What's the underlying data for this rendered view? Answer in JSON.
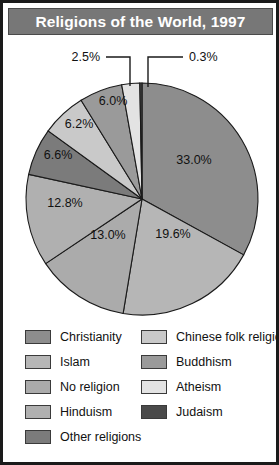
{
  "header": {
    "title": "Religions of the World, 1997",
    "background_color": "#777777",
    "text_color": "#ffffff"
  },
  "frame": {
    "border_color": "#1a1a1a",
    "background_color": "#ffffff"
  },
  "chart_data": {
    "type": "pie",
    "title": "Religions of the World, 1997",
    "xlabel": "",
    "ylabel": "",
    "legend_position": "bottom",
    "grid": false,
    "start_angle_deg": 0,
    "direction": "clockwise",
    "categories": [
      "Christianity",
      "Islam",
      "No religion",
      "Hinduism",
      "Other religions",
      "Chinese folk religion",
      "Buddhism",
      "Atheism",
      "Judaism"
    ],
    "values": [
      33.0,
      19.6,
      13.0,
      12.8,
      6.6,
      6.2,
      6.0,
      2.5,
      0.3
    ],
    "value_unit": "%",
    "colors": [
      "#8d8d8d",
      "#b6b6b6",
      "#ababab",
      "#b0b0b0",
      "#7b7b7b",
      "#c9c9c9",
      "#9a9a9a",
      "#e3e3e3",
      "#4a4a4a"
    ],
    "slices": [
      {
        "label": "Christianity",
        "value": 33.0,
        "display": "33.0%",
        "color": "#8d8d8d",
        "label_placement": "inside"
      },
      {
        "label": "Islam",
        "value": 19.6,
        "display": "19.6%",
        "color": "#b6b6b6",
        "label_placement": "inside"
      },
      {
        "label": "No religion",
        "value": 13.0,
        "display": "13.0%",
        "color": "#ababab",
        "label_placement": "inside"
      },
      {
        "label": "Hinduism",
        "value": 12.8,
        "display": "12.8%",
        "color": "#b0b0b0",
        "label_placement": "inside"
      },
      {
        "label": "Other religions",
        "value": 6.6,
        "display": "6.6%",
        "color": "#7b7b7b",
        "label_placement": "inside"
      },
      {
        "label": "Chinese folk religion",
        "value": 6.2,
        "display": "6.2%",
        "color": "#c9c9c9",
        "label_placement": "inside"
      },
      {
        "label": "Buddhism",
        "value": 6.0,
        "display": "6.0%",
        "color": "#9a9a9a",
        "label_placement": "inside"
      },
      {
        "label": "Atheism",
        "value": 2.5,
        "display": "2.5%",
        "color": "#e3e3e3",
        "label_placement": "callout"
      },
      {
        "label": "Judaism",
        "value": 0.3,
        "display": "0.3%",
        "color": "#4a4a4a",
        "label_placement": "callout"
      }
    ]
  },
  "pie_labels": {
    "christianity": "33.0%",
    "islam": "19.6%",
    "no_religion": "13.0%",
    "hinduism": "12.8%",
    "other_religions": "6.6%",
    "chinese_folk_religion": "6.2%",
    "buddhism": "6.0%",
    "atheism": "2.5%",
    "judaism": "0.3%"
  },
  "legend": {
    "left_column": [
      {
        "label": "Christianity",
        "color": "#8d8d8d"
      },
      {
        "label": "Islam",
        "color": "#b6b6b6"
      },
      {
        "label": "No religion",
        "color": "#ababab"
      },
      {
        "label": "Hinduism",
        "color": "#b0b0b0"
      },
      {
        "label": "Other religions",
        "color": "#7b7b7b"
      }
    ],
    "right_column": [
      {
        "label": "Chinese folk religion",
        "color": "#c9c9c9"
      },
      {
        "label": "Buddhism",
        "color": "#9a9a9a"
      },
      {
        "label": "Atheism",
        "color": "#e3e3e3"
      },
      {
        "label": "Judaism",
        "color": "#4a4a4a"
      }
    ]
  }
}
